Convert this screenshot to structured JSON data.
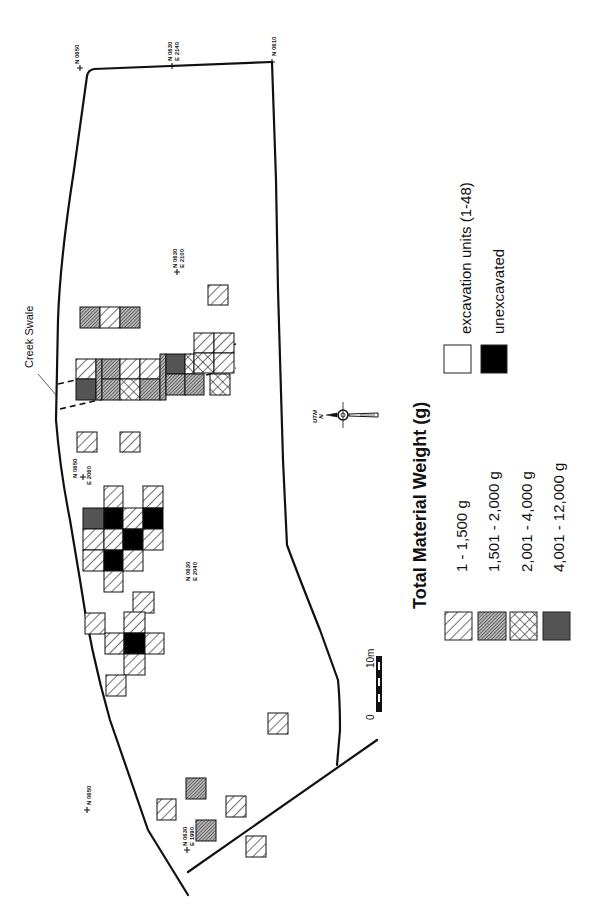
{
  "legend": {
    "title": "Total Material Weight (g)",
    "weight_classes": [
      {
        "label": "1 - 1,500 g",
        "pattern": "hatch-light"
      },
      {
        "label": "1,501 - 2,000 g",
        "pattern": "hatch-dense"
      },
      {
        "label": "2,001 - 4,000 g",
        "pattern": "crosshatch"
      },
      {
        "label": "4,001 - 12,000 g",
        "pattern": "solid-dark-gray"
      }
    ],
    "unit_types": [
      {
        "label": "excavation units (1-48)",
        "fill": "#ffffff"
      },
      {
        "label": "unexcavated",
        "fill": "#000000"
      }
    ]
  },
  "annotations": {
    "creek_swale": "Creek Swale",
    "utm_label": "UTM",
    "north_label": "N",
    "scale_zero": "0",
    "scale_max": "10m"
  },
  "grid_points": [
    {
      "id": "gp1",
      "line1": "N 0650",
      "line2": ""
    },
    {
      "id": "gp2",
      "line1": "N 0630",
      "line2": "E 2140"
    },
    {
      "id": "gp3",
      "line1": "N 0610",
      "line2": ""
    },
    {
      "id": "gp4",
      "line1": "N 0630",
      "line2": "E 2100"
    },
    {
      "id": "gp5",
      "line1": "N 0650",
      "line2": "E 2060"
    },
    {
      "id": "gp6",
      "line1": "N 0630",
      "line2": "E 2040"
    },
    {
      "id": "gp7",
      "line1": "N 0650",
      "line2": ""
    },
    {
      "id": "gp8",
      "line1": "N 0630",
      "line2": "E 1990"
    }
  ],
  "colors": {
    "line": "#111111",
    "dark_gray": "#555555",
    "hatch_dense_bg": "#9a9a9a",
    "unexcavated": "#000000"
  }
}
